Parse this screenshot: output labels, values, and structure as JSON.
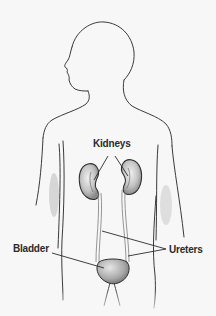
{
  "diagram": {
    "labels": {
      "kidneys": "Kidneys",
      "bladder": "Bladder",
      "ureters": "Ureters"
    },
    "colors": {
      "background": "#f7f7f7",
      "outline": "#3a3a3a",
      "organ_fill": "#cfcfcf",
      "organ_shade": "#8a8a8a",
      "leader_line": "#2a2a2a",
      "label_text": "#2a2a2a"
    }
  }
}
